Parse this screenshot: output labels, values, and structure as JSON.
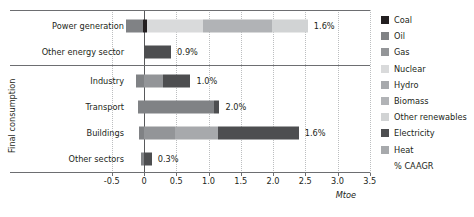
{
  "chart_data": {
    "type": "bar",
    "orientation": "horizontal",
    "stacked": true,
    "title": "",
    "xlabel": "Mtoe",
    "ylabel": "",
    "xlim": [
      -0.75,
      3.6
    ],
    "xticks": [
      "-0.5",
      "0",
      "0.5",
      "1.0",
      "1.5",
      "2.0",
      "2.5",
      "3.0",
      "3.5"
    ],
    "xtick_values": [
      -0.5,
      0,
      0.5,
      1.0,
      1.5,
      2.0,
      2.5,
      3.0,
      3.5
    ],
    "grid": "vertical-dotted",
    "legend_position": "right",
    "categories": [
      "Power generation",
      "Other energy sector",
      "Industry",
      "Transport",
      "Buildings",
      "Other sectors"
    ],
    "group_label": "Final consumption",
    "group_label_rows": [
      "Industry",
      "Transport",
      "Buildings",
      "Other sectors"
    ],
    "series": [
      {
        "name": "Coal",
        "color": "#231f20",
        "values": [
          0.06,
          0,
          0,
          0,
          0,
          0
        ]
      },
      {
        "name": "Oil",
        "color": "#808285",
        "values": [
          -0.28,
          0,
          0.13,
          1.15,
          0,
          0.05
        ]
      },
      {
        "name": "Gas",
        "color": "#939598",
        "values": [
          0,
          0,
          0.3,
          0,
          0.48,
          0
        ]
      },
      {
        "name": "Nuclear",
        "color": "#d9dadb",
        "values": [
          0.85,
          0,
          0,
          0,
          0,
          0
        ]
      },
      {
        "name": "Hydro",
        "color": "#a7a9ac",
        "values": [
          0,
          0,
          0,
          0,
          0.67,
          0
        ]
      },
      {
        "name": "Biomass",
        "color": "#b1b3b6",
        "values": [
          1.0,
          0,
          0,
          0,
          0,
          0
        ]
      },
      {
        "name": "Other renewables",
        "color": "#d1d3d4",
        "values": [
          0.52,
          0,
          0,
          0,
          0,
          0
        ]
      },
      {
        "name": "Electricity",
        "color": "#4d4e50",
        "values": [
          0,
          0.42,
          0.29,
          0.07,
          1.25,
          0.12
        ]
      },
      {
        "name": "Heat",
        "color": "#a7a9ac",
        "values": [
          0,
          0,
          0,
          0,
          0,
          0
        ]
      }
    ],
    "caagr_legend": "% CAAGR",
    "caagr_labels": [
      {
        "category": "Power generation",
        "value": "1.6%"
      },
      {
        "category": "Other energy sector",
        "value": "0.9%"
      },
      {
        "category": "Industry",
        "value": "1.0%"
      },
      {
        "category": "Transport",
        "value": "2.0%"
      },
      {
        "category": "Buildings",
        "value": "1.6%"
      },
      {
        "category": "Other sectors",
        "value": "0.3%"
      }
    ],
    "bars": [
      {
        "category": "Power generation",
        "caagr": "1.6%",
        "segments": [
          {
            "series": "Oil",
            "start": -0.28,
            "end": -0.02
          },
          {
            "series": "Coal",
            "start": -0.02,
            "end": 0.04
          },
          {
            "series": "Nuclear",
            "start": 0.04,
            "end": 0.92
          },
          {
            "series": "Biomass",
            "start": 0.92,
            "end": 1.98
          },
          {
            "series": "Other renewables",
            "start": 1.98,
            "end": 2.54
          }
        ]
      },
      {
        "category": "Other energy sector",
        "caagr": "0.9%",
        "segments": [
          {
            "series": "Electricity",
            "start": 0.0,
            "end": 0.42
          }
        ]
      },
      {
        "category": "Industry",
        "caagr": "1.0%",
        "segments": [
          {
            "series": "Oil",
            "start": -0.13,
            "end": 0.0
          },
          {
            "series": "Gas",
            "start": 0.0,
            "end": 0.3
          },
          {
            "series": "Electricity",
            "start": 0.3,
            "end": 0.72
          }
        ]
      },
      {
        "category": "Transport",
        "caagr": "2.0%",
        "segments": [
          {
            "series": "Oil",
            "start": -0.09,
            "end": 1.09
          },
          {
            "series": "Electricity",
            "start": 1.09,
            "end": 1.17
          }
        ]
      },
      {
        "category": "Buildings",
        "caagr": "1.6%",
        "segments": [
          {
            "series": "Oil",
            "start": -0.07,
            "end": 0.0
          },
          {
            "series": "Gas",
            "start": 0.0,
            "end": 0.48
          },
          {
            "series": "Hydro",
            "start": 0.48,
            "end": 1.15
          },
          {
            "series": "Electricity",
            "start": 1.15,
            "end": 2.4
          }
        ]
      },
      {
        "category": "Other sectors",
        "caagr": "0.3%",
        "segments": [
          {
            "series": "Oil",
            "start": -0.04,
            "end": 0.0
          },
          {
            "series": "Electricity",
            "start": 0.0,
            "end": 0.12
          }
        ]
      }
    ],
    "legend_entries": [
      {
        "label": "Coal",
        "color": "#231f20",
        "swatch": true
      },
      {
        "label": "Oil",
        "color": "#808285",
        "swatch": true
      },
      {
        "label": "Gas",
        "color": "#939598",
        "swatch": true
      },
      {
        "label": "Nuclear",
        "color": "#d9dadb",
        "swatch": true
      },
      {
        "label": "Hydro",
        "color": "#a7a9ac",
        "swatch": true
      },
      {
        "label": "Biomass",
        "color": "#b1b3b6",
        "swatch": true
      },
      {
        "label": "Other renewables",
        "color": "#d1d3d4",
        "swatch": true
      },
      {
        "label": "Electricity",
        "color": "#4d4e50",
        "swatch": true
      },
      {
        "label": "Heat",
        "color": "#a7a9ac",
        "swatch": true
      },
      {
        "label": "% CAAGR",
        "color": "transparent",
        "swatch": false
      }
    ]
  }
}
